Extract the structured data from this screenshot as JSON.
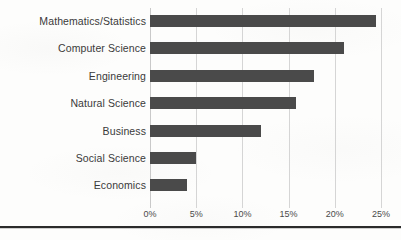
{
  "chart_data": {
    "type": "bar",
    "orientation": "horizontal",
    "title": "",
    "subtitle": "",
    "xlabel": "",
    "ylabel": "",
    "categories": [
      "Mathematics/Statistics",
      "Computer Science",
      "Engineering",
      "Natural Science",
      "Business",
      "Social Science",
      "Economics"
    ],
    "values": [
      24.5,
      21.0,
      17.8,
      15.8,
      12.0,
      5.0,
      4.0
    ],
    "value_unit": "%",
    "xlim": [
      0,
      25
    ],
    "xticks": [
      0,
      5,
      10,
      15,
      20,
      25
    ],
    "xtick_labels": [
      "0%",
      "5%",
      "10%",
      "15%",
      "20%",
      "25%"
    ],
    "grid": "vertical",
    "legend": "none",
    "bar_color": "#4a4a4a",
    "gridline_color": "#d5d5d5",
    "label_color": "#3a3a3a",
    "background_color": "#fdfdfc"
  }
}
